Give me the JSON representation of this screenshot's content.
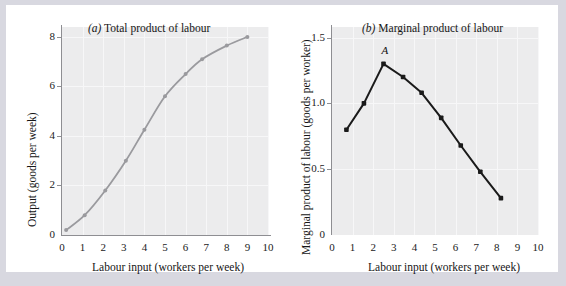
{
  "figure": {
    "background_color": "#d8d8e0",
    "card_color": "#ffffff",
    "plot_background": "#ececed"
  },
  "panels": [
    {
      "key": "a",
      "title_prefix": "(a)",
      "title_text": "Total product of labour",
      "xlabel": "Labour input (workers per week)",
      "ylabel": "Output (goods per week)",
      "series_color": "#9a9a9e",
      "x_ticks": [
        "0",
        "1",
        "2",
        "3",
        "4",
        "5",
        "6",
        "7",
        "8",
        "9",
        "10"
      ],
      "y_ticks": [
        "0",
        "2",
        "4",
        "6",
        "8"
      ]
    },
    {
      "key": "b",
      "title_prefix": "(b)",
      "title_text": "Marginal product of labour",
      "xlabel": "Labour input (workers per week)",
      "ylabel": "Marginal product of labour (goods per worker)",
      "series_color": "#1a1a1a",
      "x_ticks": [
        "0",
        "1",
        "2",
        "3",
        "4",
        "5",
        "6",
        "7",
        "8",
        "9",
        "10"
      ],
      "y_ticks": [
        "0",
        "0.5",
        "1.0",
        "1.5"
      ],
      "annotation_label": "A"
    }
  ],
  "chart_data": [
    {
      "type": "line",
      "title": "(a) Total product of labour",
      "xlabel": "Labour input (workers per week)",
      "ylabel": "Output (goods per week)",
      "xlim": [
        0,
        10
      ],
      "ylim": [
        0,
        8.4
      ],
      "xticks": [
        0,
        1,
        2,
        3,
        4,
        5,
        6,
        7,
        8,
        9,
        10
      ],
      "yticks": [
        0,
        2,
        4,
        6,
        8
      ],
      "grid": true,
      "legend": "none",
      "color": "#9a9a9e",
      "markers": true,
      "series": [
        {
          "name": "Total product of labour",
          "x": [
            0.2,
            1.1,
            2.1,
            3.1,
            4.0,
            5.0,
            6.0,
            6.8,
            8.0,
            9.0
          ],
          "y": [
            0.2,
            0.8,
            1.8,
            3.0,
            4.25,
            5.6,
            6.5,
            7.1,
            7.65,
            8.0
          ]
        }
      ]
    },
    {
      "type": "line",
      "title": "(b) Marginal product of labour",
      "xlabel": "Labour input (workers per week)",
      "ylabel": "Marginal product of labour (goods per worker)",
      "xlim": [
        0,
        10
      ],
      "ylim": [
        0,
        1.58
      ],
      "xticks": [
        0,
        1,
        2,
        3,
        4,
        5,
        6,
        7,
        8,
        9,
        10
      ],
      "yticks": [
        0,
        0.5,
        1.0,
        1.5
      ],
      "grid": true,
      "legend": "none",
      "color": "#1a1a1a",
      "markers": true,
      "annotations": [
        {
          "label": "A",
          "x": 2.5,
          "y": 1.3,
          "note": "maximum marginal product"
        }
      ],
      "series": [
        {
          "name": "Marginal product of labour",
          "x": [
            0.7,
            1.55,
            2.5,
            3.45,
            4.35,
            5.3,
            6.25,
            7.2,
            8.2
          ],
          "y": [
            0.8,
            1.0,
            1.3,
            1.2,
            1.08,
            0.89,
            0.68,
            0.48,
            0.28
          ]
        }
      ]
    }
  ]
}
